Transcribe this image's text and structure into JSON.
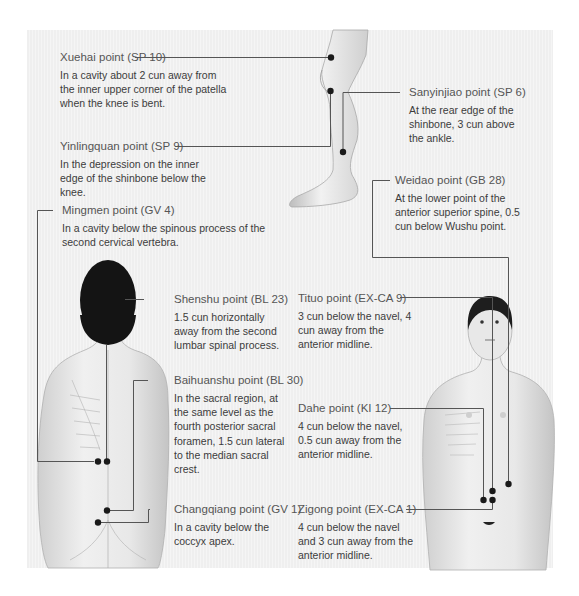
{
  "points": [
    {
      "id": "xuehai",
      "title": "Xuehai point (SP 10)",
      "desc": "In a cavity about 2 cun away from the inner upper corner of the patella when the knee is bent."
    },
    {
      "id": "yinlingquan",
      "title": "Yinlingquan point (SP 9)",
      "desc": "In the depression on the inner edge of the shinbone below the knee."
    },
    {
      "id": "sanyinjiao",
      "title": "Sanyinjiao point (SP 6)",
      "desc": "At the rear edge of the shinbone, 3 cun above the ankle."
    },
    {
      "id": "weidao",
      "title": "Weidao point (GB 28)",
      "desc": "At the lower point of the anterior superior spine, 0.5 cun below Wushu point."
    },
    {
      "id": "mingmen",
      "title": "Mingmen point (GV 4)",
      "desc": "In a cavity below the spinous process of the second cervical vertebra."
    },
    {
      "id": "shenshu",
      "title": "Shenshu point (BL 23)",
      "desc": "1.5 cun horizontally away from the second lumbar spinal process."
    },
    {
      "id": "tituo",
      "title": "Tituo point (EX-CA 9)",
      "desc": "3 cun below the navel, 4 cun away from the anterior midline."
    },
    {
      "id": "baihuanshu",
      "title": "Baihuanshu point (BL 30)",
      "desc": "In the sacral region, at the same level as the fourth posterior sacral foramen, 1.5 cun lateral to the median sacral crest."
    },
    {
      "id": "dahe",
      "title": "Dahe point (KI 12)",
      "desc": "4 cun below the navel, 0.5 cun away from the anterior midline."
    },
    {
      "id": "changqiang",
      "title": "Changqiang point (GV 1)",
      "desc": "In a cavity below the coccyx apex."
    },
    {
      "id": "zigong",
      "title": "Zigong point (EX-CA 1)",
      "desc": "4 cun below the navel and 3 cun away from the anterior midline."
    }
  ],
  "figures": {
    "leg": "leg-side-view",
    "back": "female-back-view",
    "front": "female-front-view"
  },
  "colors": {
    "panel": "#f2f2f2",
    "line": "#555555",
    "dot": "#1a1a1a",
    "hair": "#141414",
    "skin": "#e6e6e6"
  }
}
